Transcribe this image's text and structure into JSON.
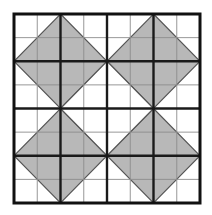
{
  "figure": {
    "width": 212,
    "height": 215
  },
  "canvas": {
    "background": "#ffffff",
    "origin_x": 14,
    "origin_y": 14,
    "block_width": 186,
    "block_height": 189,
    "grid_divisions": 8,
    "cell_width": 23.25,
    "cell_height": 23.625
  },
  "palette": {
    "background": "#ffffff",
    "white_patch": "#ffffff",
    "light_gray_patch": "#b8b8b8",
    "dark_gray_patch": "#909090",
    "thick_line": "#1a1a1a",
    "thin_line": "#8c8c8c",
    "outer_border": "#111111"
  },
  "lines": {
    "outer_border_width": 3,
    "thick_line_width": 2.4,
    "thin_line_width": 0.9,
    "thick_line_indices": [
      0,
      2,
      4,
      6,
      8
    ],
    "thin_line_indices": [
      1,
      3,
      5,
      7
    ],
    "patch_edge_width": 1.1,
    "patch_edge_color": "#555555"
  },
  "patches": {
    "note": "Grid coordinates in cell units, origin at top-left of the block, 8 x 8 cells",
    "dark_field": {
      "shape": "polygon",
      "fill": "dark_gray_patch",
      "points": [
        [
          2,
          2
        ],
        [
          6,
          2
        ],
        [
          6,
          6
        ],
        [
          2,
          6
        ]
      ]
    },
    "white_center_diamond": {
      "shape": "polygon",
      "fill": "white_patch",
      "points": [
        [
          4,
          2
        ],
        [
          6,
          4
        ],
        [
          4,
          6
        ],
        [
          2,
          4
        ]
      ]
    },
    "star_points": [
      {
        "name": "star-point-top-left",
        "fill": "light_gray_patch",
        "points": [
          [
            2,
            0
          ],
          [
            4,
            2
          ],
          [
            2,
            4
          ],
          [
            0,
            2
          ]
        ]
      },
      {
        "name": "star-point-top-right",
        "fill": "light_gray_patch",
        "points": [
          [
            6,
            0
          ],
          [
            8,
            2
          ],
          [
            6,
            4
          ],
          [
            4,
            2
          ]
        ]
      },
      {
        "name": "star-point-bottom-left",
        "fill": "light_gray_patch",
        "points": [
          [
            2,
            4
          ],
          [
            4,
            6
          ],
          [
            2,
            8
          ],
          [
            0,
            6
          ]
        ]
      },
      {
        "name": "star-point-bottom-right",
        "fill": "light_gray_patch",
        "points": [
          [
            6,
            4
          ],
          [
            8,
            6
          ],
          [
            6,
            8
          ],
          [
            4,
            6
          ]
        ]
      }
    ],
    "corner_accents": [
      {
        "name": "corner-accent-top-left",
        "fill": "dark_gray_patch",
        "points": [
          [
            2,
            2
          ],
          [
            4,
            2
          ],
          [
            4,
            4
          ],
          [
            2,
            4
          ]
        ]
      },
      {
        "name": "corner-accent-top-right",
        "fill": "dark_gray_patch",
        "points": [
          [
            4,
            2
          ],
          [
            6,
            2
          ],
          [
            6,
            4
          ],
          [
            4,
            4
          ]
        ]
      },
      {
        "name": "corner-accent-bottom-left",
        "fill": "dark_gray_patch",
        "points": [
          [
            2,
            4
          ],
          [
            4,
            4
          ],
          [
            4,
            6
          ],
          [
            2,
            6
          ]
        ]
      },
      {
        "name": "corner-accent-bottom-right",
        "fill": "dark_gray_patch",
        "points": [
          [
            4,
            4
          ],
          [
            6,
            4
          ],
          [
            6,
            6
          ],
          [
            4,
            6
          ]
        ]
      }
    ]
  },
  "labels": {
    "caption": ""
  }
}
